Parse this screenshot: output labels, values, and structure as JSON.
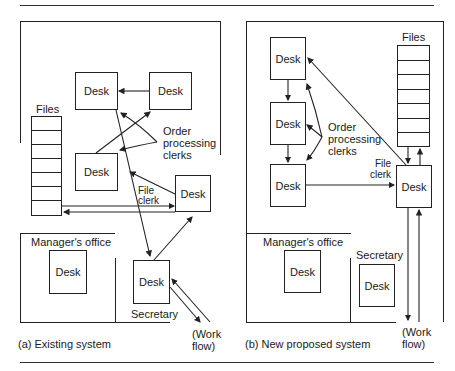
{
  "panels": [
    {
      "caption": "(a) Existing system",
      "files_label": "Files",
      "desk_label": "Desk",
      "clerks_label_1": "Order",
      "clerks_label_2": "processing",
      "clerks_label_3": "clerks",
      "file_clerk_1": "File",
      "file_clerk_2": "clerk",
      "manager_label": "Manager's office",
      "secretary_label": "Secretary",
      "workflow_1": "(Work",
      "workflow_2": "flow)"
    },
    {
      "caption": "(b) New proposed system",
      "files_label": "Files",
      "desk_label": "Desk",
      "clerks_label_1": "Order",
      "clerks_label_2": "processing",
      "clerks_label_3": "clerks",
      "file_clerk_1": "File",
      "file_clerk_2": "clerk",
      "manager_label": "Manager's office",
      "secretary_label": "Secretary",
      "workflow_1": "(Work",
      "workflow_2": "flow)"
    }
  ],
  "colors": {
    "line": "#222222",
    "background": "#ffffff"
  }
}
